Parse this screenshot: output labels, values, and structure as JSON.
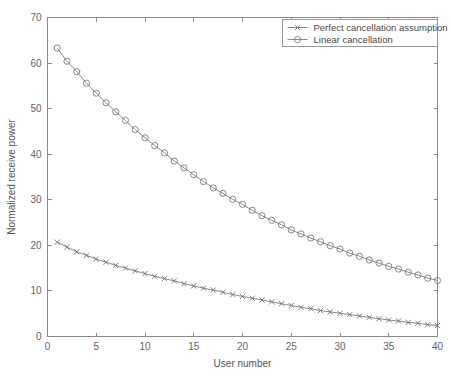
{
  "chart_data": {
    "type": "line",
    "title": "",
    "xlabel": "User number",
    "ylabel": "Normalized receive power",
    "xlim": [
      0,
      40
    ],
    "ylim": [
      0,
      70
    ],
    "xticks": [
      0,
      5,
      10,
      15,
      20,
      25,
      30,
      35,
      40
    ],
    "yticks": [
      0,
      10,
      20,
      30,
      40,
      50,
      60,
      70
    ],
    "grid": false,
    "legend_position": "top-right",
    "x": [
      1,
      2,
      3,
      4,
      5,
      6,
      7,
      8,
      9,
      10,
      11,
      12,
      13,
      14,
      15,
      16,
      17,
      18,
      19,
      20,
      21,
      22,
      23,
      24,
      25,
      26,
      27,
      28,
      29,
      30,
      31,
      32,
      33,
      34,
      35,
      36,
      37,
      38,
      39,
      40
    ],
    "series": [
      {
        "name": "Perfect cancellation assumption",
        "marker": "x",
        "color": "#6f6f6f",
        "values": [
          20.7,
          19.6,
          18.6,
          17.8,
          17.0,
          16.3,
          15.6,
          15.0,
          14.4,
          13.8,
          13.2,
          12.7,
          12.2,
          11.6,
          11.1,
          10.6,
          10.2,
          9.7,
          9.2,
          8.8,
          8.4,
          8.0,
          7.6,
          7.2,
          6.8,
          6.4,
          6.1,
          5.7,
          5.4,
          5.1,
          4.8,
          4.5,
          4.2,
          3.9,
          3.6,
          3.4,
          3.1,
          2.9,
          2.6,
          2.4
        ]
      },
      {
        "name": "Linear cancellation",
        "marker": "o",
        "color": "#7d7d7d",
        "values": [
          63.3,
          60.4,
          58.1,
          55.6,
          53.4,
          51.3,
          49.3,
          47.4,
          45.4,
          43.6,
          41.9,
          40.3,
          38.5,
          37.0,
          35.5,
          34.0,
          32.6,
          31.4,
          30.1,
          29.0,
          27.7,
          26.5,
          25.5,
          24.5,
          23.4,
          22.5,
          21.6,
          20.8,
          19.9,
          19.2,
          18.3,
          17.6,
          16.8,
          16.1,
          15.4,
          14.8,
          14.1,
          13.5,
          12.8,
          12.3
        ]
      }
    ]
  },
  "legend": {
    "entries": [
      {
        "label": "Perfect cancellation assumption",
        "marker": "cross-marker"
      },
      {
        "label": "Linear cancellation",
        "marker": "circle-marker"
      }
    ]
  },
  "axes": {
    "x_title": "User number",
    "y_title": "Normalized receive power",
    "x_tick_labels": [
      "0",
      "5",
      "10",
      "15",
      "20",
      "25",
      "30",
      "35",
      "40"
    ],
    "y_tick_labels": [
      "0",
      "10",
      "20",
      "30",
      "40",
      "50",
      "60",
      "70"
    ]
  },
  "colors": {
    "background": "#ffffff",
    "axis": "#8a8a8a",
    "series": "#7d7d7d",
    "text": "#555555"
  }
}
